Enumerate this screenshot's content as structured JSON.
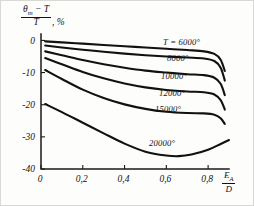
{
  "figure": {
    "background_color": "#fdfdfc",
    "curve_color": "#111111",
    "axis_color": "#1a1a1a"
  },
  "ylabel": {
    "numerator": "θₘ − T",
    "numerator_main": "θ",
    "numerator_sub": "m",
    "numerator_rest": "− T",
    "denominator": "T",
    "suffix": ", %"
  },
  "xlabel": {
    "numerator_main": "E",
    "numerator_sub": "A",
    "denominator": "D"
  },
  "chart_data": {
    "type": "line",
    "title": "",
    "subtitle": "",
    "xlabel": "E_A / D",
    "ylabel": "(θ_m − T) / T, %",
    "xlim": [
      0,
      0.9
    ],
    "ylim": [
      -40,
      2
    ],
    "grid": false,
    "legend_position": "inline-curve-labels",
    "xticks": [
      0,
      0.2,
      0.4,
      0.6,
      0.8
    ],
    "xtick_labels": [
      "0",
      "0,2",
      "0,4",
      "0,6",
      "0,8"
    ],
    "yticks": [
      0,
      -10,
      -20,
      -30,
      -40
    ],
    "ytick_labels": [
      "0",
      "-10",
      "-20",
      "-30",
      "-40"
    ],
    "series": [
      {
        "name": "T = 6000°",
        "label": "T = 6000°",
        "x": [
          0.02,
          0.1,
          0.2,
          0.3,
          0.4,
          0.5,
          0.6,
          0.7,
          0.78,
          0.83,
          0.86,
          0.88
        ],
        "values": [
          -0.3,
          -0.6,
          -1.0,
          -1.4,
          -1.8,
          -2.2,
          -2.6,
          -3.0,
          -3.4,
          -4.2,
          -6.0,
          -9.5
        ]
      },
      {
        "name": "8000°",
        "label": "8000°",
        "x": [
          0.02,
          0.1,
          0.2,
          0.3,
          0.4,
          0.5,
          0.6,
          0.7,
          0.78,
          0.83,
          0.86,
          0.88
        ],
        "values": [
          -1.6,
          -2.2,
          -2.9,
          -3.5,
          -4.1,
          -4.6,
          -5.0,
          -5.3,
          -5.6,
          -6.4,
          -8.5,
          -12.5
        ]
      },
      {
        "name": "10000°",
        "label": "10000°",
        "x": [
          0.02,
          0.1,
          0.2,
          0.3,
          0.4,
          0.5,
          0.6,
          0.7,
          0.78,
          0.83,
          0.86,
          0.88
        ],
        "values": [
          -3.4,
          -4.6,
          -6.1,
          -7.4,
          -8.5,
          -9.4,
          -10.0,
          -10.5,
          -10.8,
          -11.6,
          -13.5,
          -17.0
        ]
      },
      {
        "name": "12000°",
        "label": "12000°",
        "x": [
          0.02,
          0.1,
          0.2,
          0.3,
          0.4,
          0.5,
          0.6,
          0.7,
          0.78,
          0.83,
          0.86,
          0.88
        ],
        "values": [
          -5.5,
          -7.4,
          -9.8,
          -11.8,
          -13.4,
          -14.6,
          -15.4,
          -15.9,
          -16.1,
          -16.8,
          -18.6,
          -21.5
        ]
      },
      {
        "name": "15000°",
        "label": "15000°",
        "x": [
          0.02,
          0.1,
          0.2,
          0.3,
          0.4,
          0.5,
          0.6,
          0.7,
          0.78,
          0.83,
          0.86,
          0.88
        ],
        "values": [
          -9.2,
          -12.0,
          -15.3,
          -17.9,
          -19.9,
          -21.3,
          -22.2,
          -22.6,
          -22.7,
          -23.1,
          -24.2,
          -26.0
        ]
      },
      {
        "name": "20000°",
        "label": "20000°",
        "x": [
          0.02,
          0.1,
          0.2,
          0.3,
          0.4,
          0.5,
          0.6,
          0.66,
          0.72,
          0.8,
          0.86,
          0.9
        ],
        "values": [
          -19.8,
          -22.3,
          -25.6,
          -28.9,
          -32.1,
          -34.6,
          -35.8,
          -36.0,
          -35.5,
          -34.0,
          -32.2,
          -31.0
        ]
      }
    ],
    "series_label_positions": [
      {
        "label": "T = 6000°",
        "x_px": 162,
        "y_px": 44
      },
      {
        "label": "8000°",
        "x_px": 166,
        "y_px": 60
      },
      {
        "label": "10000°",
        "x_px": 160,
        "y_px": 78
      },
      {
        "label": "12000°",
        "x_px": 158,
        "y_px": 95
      },
      {
        "label": "15000°",
        "x_px": 154,
        "y_px": 111
      },
      {
        "label": "20000°",
        "x_px": 148,
        "y_px": 145
      }
    ]
  }
}
